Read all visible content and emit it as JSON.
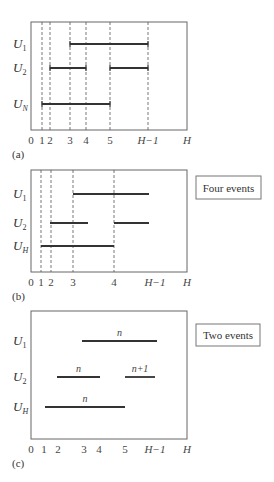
{
  "panels": [
    {
      "id": "a",
      "caption": "(a)",
      "box": {
        "x": 31,
        "y": 22,
        "w": 156,
        "h": 108
      },
      "ticks": [
        {
          "label": "0",
          "x": 31,
          "italic": false
        },
        {
          "label": "1",
          "x": 42,
          "italic": false
        },
        {
          "label": "2",
          "x": 50,
          "italic": false
        },
        {
          "label": "3",
          "x": 70,
          "italic": false
        },
        {
          "label": "4",
          "x": 86,
          "italic": false
        },
        {
          "label": "5",
          "x": 110,
          "italic": false
        },
        {
          "label": "H−1",
          "x": 148,
          "italic": true
        },
        {
          "label": "H",
          "x": 187,
          "italic": true
        }
      ],
      "dashed_x": [
        42,
        50,
        70,
        86,
        110,
        148
      ],
      "rows": [
        {
          "name": "U",
          "sub": "1",
          "sub_italic": false,
          "y": 44,
          "bars": [
            {
              "x1": 70,
              "x2": 148,
              "caps": true
            }
          ]
        },
        {
          "name": "U",
          "sub": "2",
          "sub_italic": false,
          "y": 68,
          "bars": [
            {
              "x1": 50,
              "x2": 86,
              "caps": true
            },
            {
              "x1": 110,
              "x2": 148,
              "caps": true
            }
          ]
        },
        {
          "name": "U",
          "sub": "N",
          "sub_italic": true,
          "y": 104,
          "bars": [
            {
              "x1": 42,
              "x2": 110,
              "caps": true
            }
          ]
        }
      ]
    },
    {
      "id": "b",
      "caption": "(b)",
      "box": {
        "x": 31,
        "y": 170,
        "w": 156,
        "h": 102
      },
      "ticks": [
        {
          "label": "0",
          "x": 31,
          "italic": false
        },
        {
          "label": "1",
          "x": 41,
          "italic": false
        },
        {
          "label": "2",
          "x": 51,
          "italic": false
        },
        {
          "label": "3",
          "x": 73,
          "italic": false
        },
        {
          "label": "4",
          "x": 114,
          "italic": false
        },
        {
          "label": "H−1",
          "x": 155,
          "italic": true
        },
        {
          "label": "H",
          "x": 187,
          "italic": true
        }
      ],
      "dashed_x": [
        41,
        51,
        73,
        114
      ],
      "rows": [
        {
          "name": "U",
          "sub": "1",
          "sub_italic": false,
          "y": 194,
          "bars": [
            {
              "x1": 73,
              "x2": 149,
              "caps": false
            }
          ]
        },
        {
          "name": "U",
          "sub": "2",
          "sub_italic": false,
          "y": 223,
          "bars": [
            {
              "x1": 50,
              "x2": 88,
              "caps": false
            },
            {
              "x1": 114,
              "x2": 149,
              "caps": false
            }
          ]
        },
        {
          "name": "U",
          "sub": "H",
          "sub_italic": true,
          "y": 246,
          "bars": [
            {
              "x1": 41,
              "x2": 114,
              "caps": false
            }
          ]
        }
      ],
      "legend": {
        "text": "Four events",
        "x": 196,
        "y": 176,
        "w": 65,
        "h": 23
      }
    },
    {
      "id": "c",
      "caption": "(c)",
      "box": {
        "x": 31,
        "y": 311,
        "w": 156,
        "h": 128
      },
      "ticks": [
        {
          "label": "0",
          "x": 31,
          "italic": false
        },
        {
          "label": "1",
          "x": 44,
          "italic": false
        },
        {
          "label": "2",
          "x": 58,
          "italic": false
        },
        {
          "label": "3",
          "x": 84,
          "italic": false
        },
        {
          "label": "4",
          "x": 99,
          "italic": false
        },
        {
          "label": "5",
          "x": 125,
          "italic": false
        },
        {
          "label": "H−1",
          "x": 155,
          "italic": true
        },
        {
          "label": "H",
          "x": 187,
          "italic": true
        }
      ],
      "dashed_x": [],
      "rows": [
        {
          "name": "U",
          "sub": "1",
          "sub_italic": false,
          "y": 341,
          "bars": [
            {
              "x1": 82,
              "x2": 157,
              "caps": false,
              "label": "n"
            }
          ]
        },
        {
          "name": "U",
          "sub": "2",
          "sub_italic": false,
          "y": 377,
          "bars": [
            {
              "x1": 57,
              "x2": 100,
              "caps": false,
              "label": "n"
            },
            {
              "x1": 125,
              "x2": 155,
              "caps": false,
              "label": "n+1"
            }
          ]
        },
        {
          "name": "U",
          "sub": "H",
          "sub_italic": true,
          "y": 407,
          "bars": [
            {
              "x1": 45,
              "x2": 125,
              "caps": false,
              "label": "n"
            }
          ]
        }
      ],
      "legend": {
        "text": "Two events",
        "x": 196,
        "y": 324,
        "w": 64,
        "h": 22
      }
    }
  ]
}
